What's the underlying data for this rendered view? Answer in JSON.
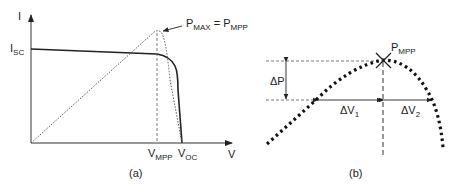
{
  "panel_a": {
    "caption": "(a)",
    "y_axis_label": "I",
    "x_axis_label": "V",
    "isc_label": {
      "main": "I",
      "sub": "SC"
    },
    "vmpp_label": {
      "main": "V",
      "sub": "MPP"
    },
    "voc_label": {
      "main": "V",
      "sub": "OC"
    },
    "pmax_label": {
      "main1": "P",
      "sub1": "MAX",
      "eq": " = ",
      "main2": "P",
      "sub2": "MPP"
    },
    "curves": [
      {
        "name": "I-V curve",
        "style": "solid"
      },
      {
        "name": "P-V curve",
        "style": "dotted"
      }
    ]
  },
  "panel_b": {
    "caption": "(b)",
    "pmpp_label": {
      "main": "P",
      "sub": "MPP"
    },
    "dp_label": "ΔP",
    "dv1_label": {
      "main": "ΔV",
      "sub": "1"
    },
    "dv2_label": {
      "main": "ΔV",
      "sub": "2"
    },
    "curves": [
      {
        "name": "P-V curve around MPP",
        "style": "dotted-thick"
      }
    ]
  },
  "colors": {
    "line": "#222222",
    "dotted": "#444444",
    "background": "#ffffff"
  }
}
